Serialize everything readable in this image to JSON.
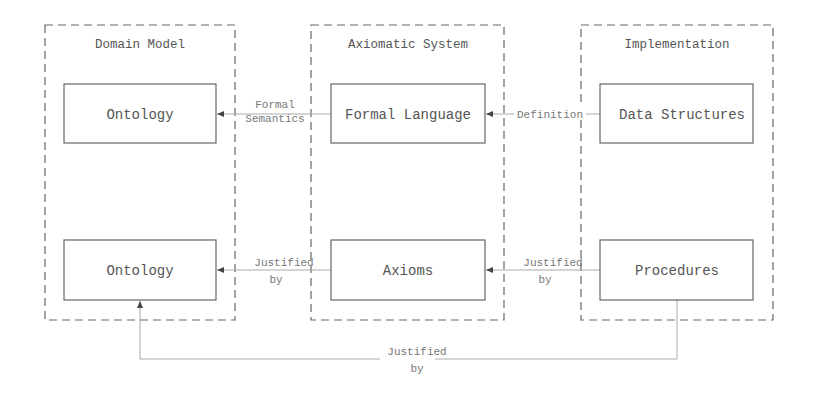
{
  "containers": [
    {
      "id": "domain",
      "title": "Domain Model"
    },
    {
      "id": "axiomatic",
      "title": "Axiomatic System"
    },
    {
      "id": "implementation",
      "title": "Implementation"
    }
  ],
  "nodes": {
    "ontology_top": "Ontology",
    "formal_language": "Formal Language",
    "data_structures": "Data Structures",
    "ontology_bottom": "Ontology",
    "axioms": "Axioms",
    "procedures": "Procedures"
  },
  "edges": {
    "formal_semantics": {
      "line1": "Formal",
      "line2": "Semantics",
      "from": "Formal Language",
      "to": "Ontology"
    },
    "definition": {
      "line1": "Definition",
      "from": "Data Structures",
      "to": "Formal Language"
    },
    "justified_axioms": {
      "line1": "Justified",
      "line2": "by",
      "from": "Axioms",
      "to": "Ontology"
    },
    "justified_procedures": {
      "line1": "Justified",
      "line2": "by",
      "from": "Procedures",
      "to": "Axioms"
    },
    "justified_bottom": {
      "line1": "Justified",
      "line2": "by",
      "from": "Procedures",
      "to": "Ontology"
    }
  }
}
